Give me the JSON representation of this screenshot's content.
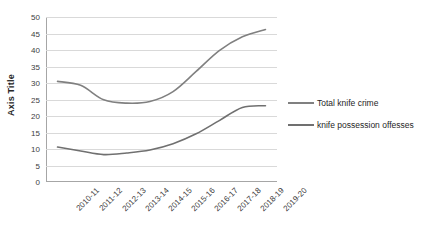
{
  "chart_data": {
    "type": "line",
    "title": "",
    "xlabel": "",
    "ylabel": "Axis Title",
    "ylim": [
      0,
      50
    ],
    "ytick_step": 5,
    "yticks": [
      50,
      45,
      40,
      35,
      30,
      25,
      20,
      15,
      10,
      5,
      0
    ],
    "grid": true,
    "legend_position": "right",
    "categories": [
      "2010-11",
      "2011-12",
      "2012-13",
      "2013-14",
      "2014-15",
      "2015-16",
      "2016-17",
      "2017-18",
      "2018-19",
      "2019-20"
    ],
    "series": [
      {
        "name": "Total knife crime",
        "color": "#808080",
        "values": [
          30.5,
          29.3,
          24.9,
          23.9,
          24.4,
          27.4,
          33.5,
          39.8,
          44.0,
          46.2
        ]
      },
      {
        "name": "knife possession offesses",
        "color": "#707070",
        "values": [
          10.6,
          9.4,
          8.3,
          8.8,
          9.7,
          11.6,
          14.6,
          18.6,
          22.6,
          23.1
        ]
      }
    ]
  },
  "legend": {
    "items": [
      {
        "label": "Total knife crime"
      },
      {
        "label": "knife possession offesses"
      }
    ]
  },
  "axes": {
    "y_title": "Axis Title"
  }
}
